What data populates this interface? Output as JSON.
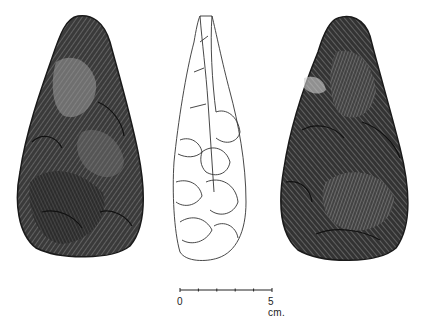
{
  "figure": {
    "views": [
      {
        "name": "face-a",
        "style": "shaded"
      },
      {
        "name": "profile",
        "style": "outline"
      },
      {
        "name": "face-b",
        "style": "shaded"
      }
    ]
  },
  "scale_bar": {
    "start_label": "0",
    "end_label": "5 cm.",
    "ticks": 6
  },
  "colors": {
    "ink": "#1a1a1a",
    "shade_dark": "#2b2b2b",
    "shade_mid": "#555555",
    "shade_light": "#9a9a9a",
    "background": "#ffffff"
  }
}
